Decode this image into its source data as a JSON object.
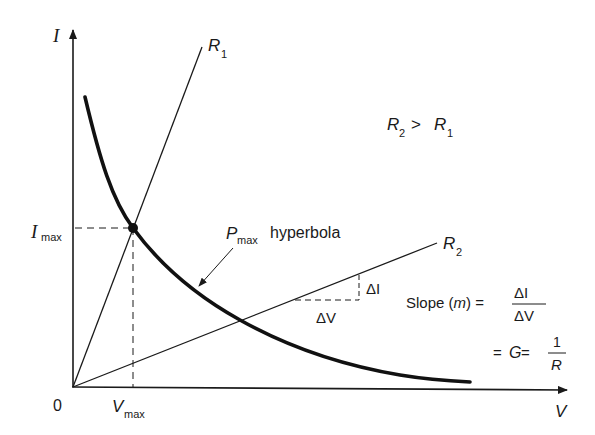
{
  "diagram": {
    "axes": {
      "y_label": "I",
      "x_label": "V",
      "origin_label": "0"
    },
    "lines": {
      "r1": {
        "label_main": "R",
        "label_sub": "1"
      },
      "r2": {
        "label_main": "R",
        "label_sub": "2"
      }
    },
    "relation": {
      "left_main": "R",
      "left_sub": "2",
      "op": ">",
      "right_main": "R",
      "right_sub": "1"
    },
    "markers": {
      "imax_main": "I",
      "imax_sub": "max",
      "vmax_main": "V",
      "vmax_sub": "max"
    },
    "hyperbola_label": {
      "p_main": "P",
      "p_sub": "max",
      "rest": "hyperbola"
    },
    "delta": {
      "di": "ΔI",
      "dv": "ΔV"
    },
    "slope_formula": {
      "prefix": "Slope (",
      "m": "m",
      "suffix": ") =",
      "numerator": "ΔI",
      "denominator": "ΔV",
      "line2_prefix": "= ",
      "g": "G",
      "line2_eq": " =",
      "num2": "1",
      "den2": "R"
    },
    "colors": {
      "ink": "#1a1a1a",
      "background": "#ffffff"
    }
  }
}
